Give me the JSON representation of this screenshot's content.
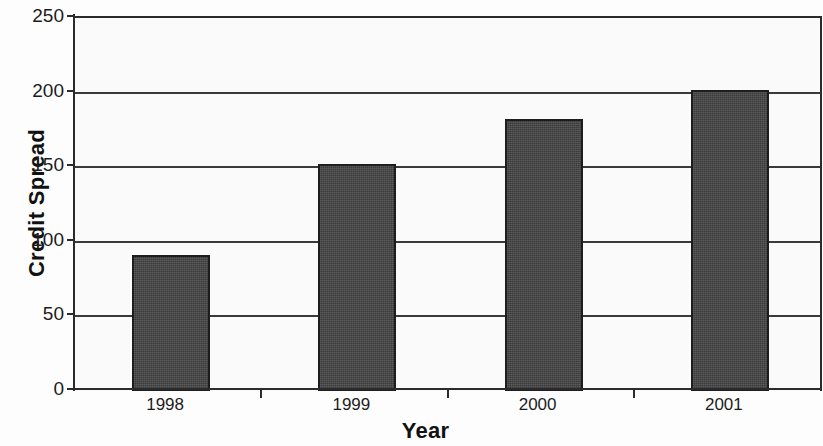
{
  "chart_data": {
    "type": "bar",
    "title": "",
    "subtitle": "",
    "xlabel": "Year",
    "ylabel": "Credit Spread",
    "categories": [
      "1998",
      "1999",
      "2000",
      "2001"
    ],
    "values": [
      91,
      152,
      182,
      202
    ],
    "series": [
      {
        "name": "Credit Spread",
        "values": [
          91,
          152,
          182,
          202
        ]
      }
    ],
    "ylim": [
      0,
      250
    ],
    "y_ticks": [
      0,
      50,
      100,
      150,
      200,
      250
    ],
    "y_tick_labels": [
      "0",
      "50",
      "100",
      "150",
      "200",
      "250"
    ],
    "grid": "horizontal",
    "legend": "none",
    "annotations": [],
    "colors": {
      "bar_fill": "#434343",
      "bar_border": "#1d1d1d",
      "gridline": "#3a3a3a",
      "axis": "#2b2b2b",
      "plot_background": "#fafafa",
      "figure_background": "#fdfdfd",
      "text": "#1c1c1c"
    }
  },
  "axes": {
    "y_title": "Credit Spread",
    "x_title": "Year"
  }
}
